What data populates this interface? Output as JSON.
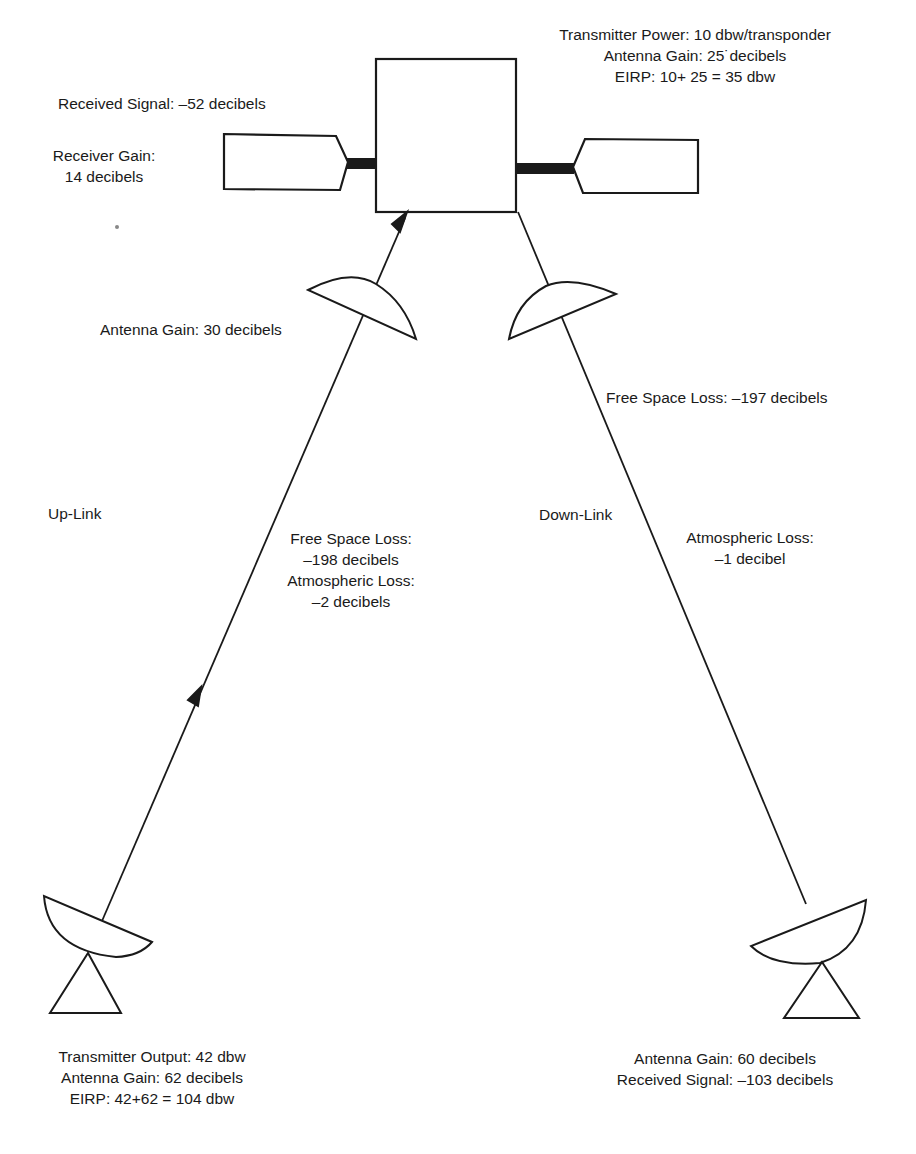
{
  "diagram": {
    "type": "satellite-link-budget",
    "colors": {
      "ink": "#1a1a1a",
      "background": "#ffffff"
    },
    "satellite": {
      "received_signal": "Received Signal: –52 decibels",
      "receiver_gain": [
        "Receiver Gain:",
        "14 decibels"
      ],
      "transmit": [
        "Transmitter Power: 10 dbw/transponder",
        "Antenna Gain: 25˙decibels",
        "EIRP: 10+ 25 = 35 dbw"
      ],
      "receive_antenna_gain": "Antenna Gain: 30 decibels"
    },
    "uplink": {
      "label": "Up-Link",
      "losses": [
        "Free Space Loss:",
        "–198 decibels",
        "Atmospheric Loss:",
        "–2 decibels"
      ]
    },
    "downlink": {
      "label": "Down-Link",
      "free_space_loss": "Free Space Loss: –197 decibels",
      "atmospheric_loss": [
        "Atmospheric Loss:",
        "–1 decibel"
      ]
    },
    "ground_transmitter": {
      "lines": [
        "Transmitter Output: 42 dbw",
        "Antenna Gain: 62 decibels",
        "EIRP: 42+62 = 104 dbw"
      ]
    },
    "ground_receiver": {
      "lines": [
        "Antenna Gain: 60 decibels",
        "Received Signal: –103 decibels"
      ]
    }
  }
}
